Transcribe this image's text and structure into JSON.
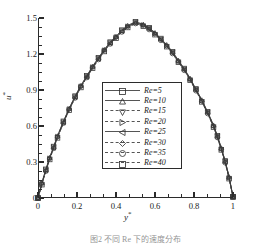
{
  "figure": {
    "caption": "图2  不同 Re 下的速度分布"
  },
  "axes": {
    "x_title": "y",
    "x_title_sup": "*",
    "y_title": "u",
    "y_title_sup": "*",
    "x_ticks": [
      "0",
      "0.2",
      "0.4",
      "0.6",
      "0.8",
      "1"
    ],
    "x_tick_values": [
      0,
      0.2,
      0.4,
      0.6,
      0.8,
      1
    ],
    "y_ticks": [
      "0",
      "0.3",
      "0.6",
      "0.9",
      "1.2",
      "1.5"
    ],
    "y_tick_values": [
      0,
      0.3,
      0.6,
      0.9,
      1.2,
      1.5
    ],
    "xlim": [
      0,
      1
    ],
    "ylim": [
      0,
      1.5
    ],
    "x_minor_per_major": 2,
    "y_minor_per_major": 3,
    "spines": "left-bottom"
  },
  "legend": {
    "position": "center-right-lower",
    "border_color": "#2b2b2b",
    "entries": [
      {
        "label": "Re=5",
        "re": 5,
        "marker": "square",
        "linestyle": "solid"
      },
      {
        "label": "Re=10",
        "re": 10,
        "marker": "triangle-up",
        "linestyle": "solid"
      },
      {
        "label": "Re=15",
        "re": 15,
        "marker": "triangle-down",
        "linestyle": "dashed"
      },
      {
        "label": "Re=20",
        "re": 20,
        "marker": "triangle-right",
        "linestyle": "dashdot"
      },
      {
        "label": "Re=25",
        "re": 25,
        "marker": "triangle-left",
        "linestyle": "solid"
      },
      {
        "label": "Re=30",
        "re": 30,
        "marker": "diamond",
        "linestyle": "dashed"
      },
      {
        "label": "Re=35",
        "re": 35,
        "marker": "circle",
        "linestyle": "dashed"
      },
      {
        "label": "Re=40",
        "re": 40,
        "marker": "square",
        "linestyle": "dashdot"
      }
    ]
  },
  "chart_data": {
    "type": "line",
    "title": "",
    "xlabel": "y*",
    "ylabel": "u*",
    "xlim": [
      0,
      1
    ],
    "ylim": [
      0,
      1.5
    ],
    "grid": false,
    "legend_position": "center-right-lower",
    "x": [
      0.0,
      0.02,
      0.04,
      0.06,
      0.08,
      0.1,
      0.13,
      0.16,
      0.19,
      0.22,
      0.25,
      0.28,
      0.31,
      0.34,
      0.37,
      0.4,
      0.43,
      0.46,
      0.5,
      0.54,
      0.57,
      0.6,
      0.63,
      0.66,
      0.69,
      0.72,
      0.75,
      0.78,
      0.81,
      0.84,
      0.87,
      0.9,
      0.92,
      0.94,
      0.96,
      0.98,
      1.0
    ],
    "series": [
      {
        "name": "Re=5",
        "marker": "square",
        "linestyle": "solid",
        "values": [
          0.0,
          0.12,
          0.23,
          0.33,
          0.42,
          0.51,
          0.63,
          0.74,
          0.84,
          0.93,
          1.01,
          1.09,
          1.16,
          1.23,
          1.29,
          1.34,
          1.39,
          1.43,
          1.46,
          1.44,
          1.41,
          1.37,
          1.32,
          1.27,
          1.21,
          1.14,
          1.07,
          0.99,
          0.9,
          0.81,
          0.71,
          0.6,
          0.51,
          0.41,
          0.3,
          0.17,
          0.01
        ]
      },
      {
        "name": "Re=10",
        "marker": "triangle-up",
        "linestyle": "solid",
        "values": [
          0.0,
          0.12,
          0.23,
          0.33,
          0.42,
          0.51,
          0.63,
          0.74,
          0.84,
          0.93,
          1.01,
          1.09,
          1.16,
          1.23,
          1.29,
          1.34,
          1.39,
          1.43,
          1.46,
          1.44,
          1.41,
          1.37,
          1.32,
          1.27,
          1.21,
          1.14,
          1.07,
          0.99,
          0.9,
          0.81,
          0.71,
          0.6,
          0.51,
          0.41,
          0.3,
          0.17,
          0.01
        ]
      },
      {
        "name": "Re=15",
        "marker": "triangle-down",
        "linestyle": "dashed",
        "values": [
          0.0,
          0.12,
          0.23,
          0.33,
          0.42,
          0.51,
          0.63,
          0.74,
          0.84,
          0.93,
          1.01,
          1.09,
          1.16,
          1.23,
          1.29,
          1.34,
          1.39,
          1.43,
          1.46,
          1.44,
          1.41,
          1.37,
          1.32,
          1.27,
          1.21,
          1.14,
          1.07,
          0.99,
          0.9,
          0.81,
          0.71,
          0.6,
          0.51,
          0.41,
          0.3,
          0.17,
          0.01
        ]
      },
      {
        "name": "Re=20",
        "marker": "triangle-right",
        "linestyle": "dashdot",
        "values": [
          0.0,
          0.12,
          0.23,
          0.33,
          0.42,
          0.51,
          0.63,
          0.74,
          0.84,
          0.93,
          1.01,
          1.09,
          1.16,
          1.23,
          1.29,
          1.34,
          1.39,
          1.43,
          1.46,
          1.44,
          1.41,
          1.37,
          1.32,
          1.27,
          1.21,
          1.14,
          1.07,
          0.99,
          0.9,
          0.81,
          0.71,
          0.6,
          0.51,
          0.41,
          0.3,
          0.17,
          0.01
        ]
      },
      {
        "name": "Re=25",
        "marker": "triangle-left",
        "linestyle": "solid",
        "values": [
          0.0,
          0.12,
          0.23,
          0.33,
          0.42,
          0.51,
          0.63,
          0.74,
          0.84,
          0.93,
          1.01,
          1.09,
          1.16,
          1.23,
          1.29,
          1.34,
          1.39,
          1.43,
          1.46,
          1.44,
          1.41,
          1.37,
          1.32,
          1.27,
          1.21,
          1.14,
          1.07,
          0.99,
          0.9,
          0.81,
          0.71,
          0.6,
          0.51,
          0.41,
          0.3,
          0.17,
          0.01
        ]
      },
      {
        "name": "Re=30",
        "marker": "diamond",
        "linestyle": "dashed",
        "values": [
          0.0,
          0.12,
          0.23,
          0.33,
          0.42,
          0.51,
          0.63,
          0.74,
          0.84,
          0.93,
          1.01,
          1.09,
          1.16,
          1.23,
          1.29,
          1.34,
          1.39,
          1.43,
          1.46,
          1.44,
          1.41,
          1.37,
          1.32,
          1.27,
          1.21,
          1.14,
          1.07,
          0.99,
          0.9,
          0.81,
          0.71,
          0.6,
          0.51,
          0.41,
          0.3,
          0.17,
          0.01
        ]
      },
      {
        "name": "Re=35",
        "marker": "circle",
        "linestyle": "dashed",
        "values": [
          0.0,
          0.12,
          0.23,
          0.33,
          0.42,
          0.51,
          0.63,
          0.74,
          0.84,
          0.93,
          1.01,
          1.09,
          1.16,
          1.23,
          1.29,
          1.34,
          1.39,
          1.43,
          1.46,
          1.44,
          1.41,
          1.37,
          1.32,
          1.27,
          1.21,
          1.14,
          1.07,
          0.99,
          0.9,
          0.81,
          0.71,
          0.6,
          0.51,
          0.41,
          0.3,
          0.17,
          0.01
        ]
      },
      {
        "name": "Re=40",
        "marker": "square",
        "linestyle": "dashdot",
        "values": [
          0.0,
          0.12,
          0.23,
          0.33,
          0.42,
          0.51,
          0.63,
          0.74,
          0.84,
          0.93,
          1.01,
          1.09,
          1.16,
          1.23,
          1.29,
          1.34,
          1.39,
          1.43,
          1.46,
          1.44,
          1.41,
          1.37,
          1.32,
          1.27,
          1.21,
          1.14,
          1.07,
          0.99,
          0.9,
          0.81,
          0.71,
          0.6,
          0.51,
          0.41,
          0.3,
          0.17,
          0.01
        ]
      }
    ]
  }
}
